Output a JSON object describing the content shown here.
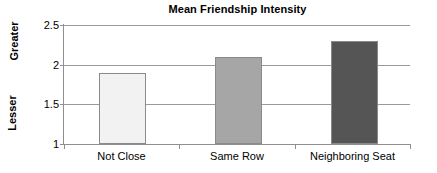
{
  "chart_data": {
    "type": "bar",
    "title": "Mean Friendship Intensity",
    "xlabel": "",
    "ylabel": "",
    "categories": [
      "Not Close",
      "Same Row",
      "Neighboring Seat"
    ],
    "values": [
      1.9,
      2.1,
      2.3
    ],
    "series": [
      {
        "name": "Mean Friendship Intensity",
        "values": [
          1.9,
          2.1,
          2.3
        ]
      }
    ],
    "ylim": [
      1,
      2.5
    ],
    "yticks": [
      "1",
      "1.5",
      "2",
      "2.5"
    ],
    "ytick_values": [
      1,
      1.5,
      2,
      2.5
    ],
    "grid": true,
    "legend": false,
    "annotations": {
      "y_axis_high_label": "Greater",
      "y_axis_low_label": "Lesser"
    },
    "bar_colors": [
      "#f2f2f2",
      "#a6a6a6",
      "#555555"
    ],
    "bar_border_color": "#8a8a8a",
    "gridline_color": "#9a9a9a",
    "axis_color": "#8f8f8f",
    "background_color": "#ffffff",
    "text_color": "#000000"
  }
}
